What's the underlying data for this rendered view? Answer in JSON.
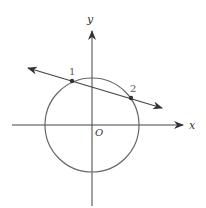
{
  "diagram": {
    "type": "coordinate-plane",
    "axes": {
      "x_label": "x",
      "y_label": "y",
      "origin_label": "O"
    },
    "circle": {
      "center": "O",
      "description": "circle centered at origin"
    },
    "line": {
      "description": "line with arrows on both ends intersecting circle at two points"
    },
    "points": [
      {
        "label": "1",
        "position": "upper-left intersection"
      },
      {
        "label": "2",
        "position": "upper-right intersection"
      }
    ],
    "colors": {
      "stroke": "#555555",
      "axis": "#444444",
      "point": "#333333"
    }
  }
}
